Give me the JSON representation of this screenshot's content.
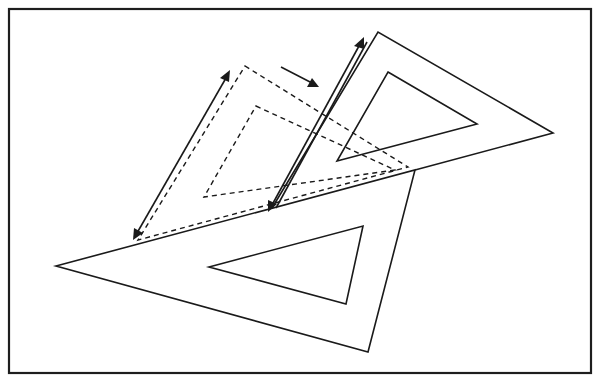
{
  "diagram": {
    "title": "",
    "colors": {
      "background": "#ffffff",
      "stroke": "#1a1a1a",
      "frame": "#1e1e1e"
    },
    "frame": {
      "x": 9,
      "y": 9,
      "width": 582,
      "height": 364
    },
    "shapes": {
      "fixed_set_square": {
        "style": "solid",
        "outer": [
          [
            56,
            266
          ],
          [
            415,
            170
          ],
          [
            368,
            352
          ]
        ],
        "inner": [
          [
            209,
            267
          ],
          [
            363,
            226
          ],
          [
            346,
            304
          ]
        ]
      },
      "moved_set_square": {
        "style": "solid",
        "outer": [
          [
            378,
            32
          ],
          [
            553,
            133
          ],
          [
            270,
            210
          ]
        ],
        "inner": [
          [
            388,
            72
          ],
          [
            477,
            124
          ],
          [
            337,
            161
          ]
        ]
      },
      "original_position_set_square": {
        "style": "dashed",
        "outer": [
          [
            245,
            66
          ],
          [
            408,
            167
          ],
          [
            138,
            240
          ]
        ],
        "inner": [
          [
            256,
            106
          ],
          [
            395,
            170
          ],
          [
            204,
            197
          ]
        ]
      }
    },
    "arrows": [
      {
        "name": "slide-distance-arrow",
        "from": [
          230,
          70
        ],
        "to": [
          133,
          240
        ],
        "double": true
      },
      {
        "name": "parallel-edge-arrow",
        "from": [
          363,
          38
        ],
        "to": [
          268,
          212
        ],
        "double": true
      },
      {
        "name": "direction-of-motion-arrow",
        "from": [
          281,
          67
        ],
        "to": [
          318,
          87
        ],
        "double": false
      }
    ],
    "labels": []
  }
}
